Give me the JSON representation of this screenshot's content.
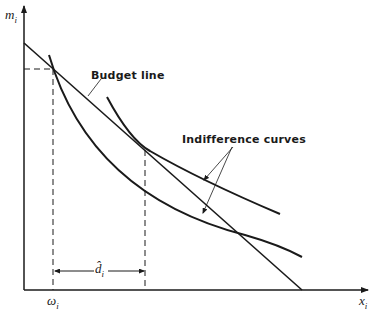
{
  "diagram": {
    "axes": {
      "y_label": "m",
      "y_label_sub": "i",
      "x_label": "x",
      "x_label_sub": "i"
    },
    "labels": {
      "budget_line": "Budget line",
      "indifference_curves": "Indifference curves",
      "endowment_symbol": "ω",
      "endowment_sub": "i",
      "demand_symbol": "d̂",
      "demand_sub": "i"
    },
    "colors": {
      "ink": "#1a1a1a",
      "background": "#ffffff"
    }
  }
}
